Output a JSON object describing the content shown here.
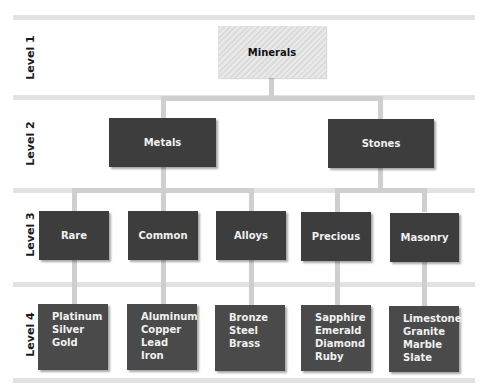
{
  "diagram": {
    "type": "hierarchy",
    "levels": [
      {
        "label": "Level 1"
      },
      {
        "label": "Level 2"
      },
      {
        "label": "Level 3"
      },
      {
        "label": "Level 4"
      }
    ],
    "root": {
      "label": "Minerals"
    },
    "level2": [
      {
        "label": "Metals"
      },
      {
        "label": "Stones"
      }
    ],
    "level3": [
      {
        "label": "Rare",
        "parent": "Metals"
      },
      {
        "label": "Common",
        "parent": "Metals"
      },
      {
        "label": "Alloys",
        "parent": "Metals"
      },
      {
        "label": "Precious",
        "parent": "Stones"
      },
      {
        "label": "Masonry",
        "parent": "Stones"
      }
    ],
    "level4": [
      {
        "parent": "Rare",
        "items": [
          "Platinum",
          "Silver",
          "Gold"
        ]
      },
      {
        "parent": "Common",
        "items": [
          "Aluminum",
          "Copper",
          "Lead",
          "Iron"
        ]
      },
      {
        "parent": "Alloys",
        "items": [
          "Bronze",
          "Steel",
          "Brass"
        ]
      },
      {
        "parent": "Precious",
        "items": [
          "Sapphire",
          "Emerald",
          "Diamond",
          "Ruby"
        ]
      },
      {
        "parent": "Masonry",
        "items": [
          "Limestone",
          "Granite",
          "Marble",
          "Slate"
        ]
      }
    ],
    "colors": {
      "box_dark": "#3d3d3d",
      "box_root": "#e2e2e2",
      "connector": "#cfcfcf",
      "separator": "#e2e2e2"
    }
  }
}
